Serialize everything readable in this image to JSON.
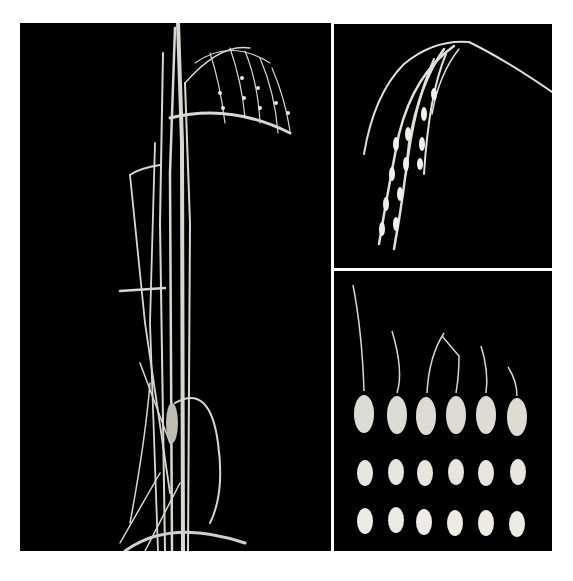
{
  "figure": {
    "header_text": "",
    "background": "#ffffff",
    "panel_background": "#000000",
    "subject_color": "#e6e6e0",
    "panels": [
      {
        "id": "plant",
        "description": "Whole rice plant with panicles growing from a pot"
      },
      {
        "id": "panicle",
        "description": "Close-up of a drooping rice panicle"
      },
      {
        "id": "seeds",
        "description": "Rice grains arranged in three rows of six",
        "rows": [
          {
            "label": "Awned paddy grains",
            "count": 6
          },
          {
            "label": "Brown rice (dehulled)",
            "count": 6
          },
          {
            "label": "Milled rice",
            "count": 6
          }
        ]
      }
    ]
  }
}
